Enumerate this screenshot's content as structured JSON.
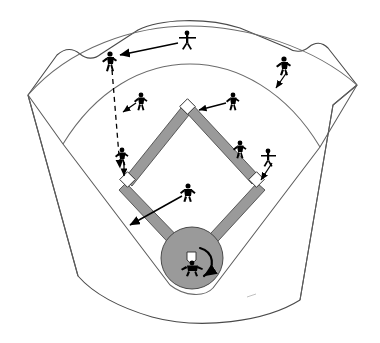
{
  "diagram": {
    "type": "baseball-field-schematic",
    "canvas": {
      "width": 380,
      "height": 343
    },
    "colors": {
      "background": "#ffffff",
      "outline": "#4a4a4a",
      "arc": "#6b6b6b",
      "basepath_fill": "#9a9a9a",
      "basepath_stroke": "#3c3c3c",
      "mound_fill": "#9a9a9a",
      "base_fill": "#ffffff",
      "figure": "#000000",
      "arrow": "#000000",
      "smudge": "#b9b9b9"
    }
  },
  "field": {
    "outfield_fence_label": "outfield-fence",
    "warning_track_arc_label": "warning-track-arc",
    "infield_arc_label": "infield-grass-arc",
    "left_foul_line_label": "left-foul-line",
    "right_foul_line_label": "right-foul-line",
    "backstop_arc_label": "backstop-arc"
  },
  "bases": [
    {
      "name": "second-base",
      "label": "2B",
      "x": 188,
      "y": 107
    },
    {
      "name": "third-base",
      "label": "3B",
      "x": 128,
      "y": 180
    },
    {
      "name": "first-base",
      "label": "1B",
      "x": 256,
      "y": 180
    },
    {
      "name": "home-plate",
      "label": "HP",
      "x": 192,
      "y": 256
    }
  ],
  "mound": {
    "name": "pitchers-mound-circle",
    "cx": 192,
    "cy": 258,
    "r": 31
  },
  "players": [
    {
      "name": "center-fielder",
      "position": "CF",
      "x": 187,
      "y": 40,
      "pose": "arms-out"
    },
    {
      "name": "left-fielder",
      "position": "LF",
      "x": 110,
      "y": 60,
      "pose": "running"
    },
    {
      "name": "right-fielder",
      "position": "RF",
      "x": 284,
      "y": 65,
      "pose": "running"
    },
    {
      "name": "shortstop",
      "position": "SS",
      "x": 140,
      "y": 100,
      "pose": "running"
    },
    {
      "name": "second-baseman",
      "position": "2B",
      "x": 232,
      "y": 100,
      "pose": "running"
    },
    {
      "name": "third-baseman",
      "position": "3B",
      "x": 122,
      "y": 155,
      "pose": "running"
    },
    {
      "name": "baserunner",
      "position": "R",
      "x": 240,
      "y": 148,
      "pose": "running"
    },
    {
      "name": "first-baseman",
      "position": "1B",
      "x": 268,
      "y": 157,
      "pose": "running"
    },
    {
      "name": "pitcher",
      "position": "P",
      "x": 187,
      "y": 192,
      "pose": "fielding"
    },
    {
      "name": "batter",
      "position": "B",
      "x": 192,
      "y": 266,
      "pose": "batting"
    }
  ],
  "movement_arrows": [
    {
      "name": "center-fielder-to-left-arrow",
      "from": "center-fielder",
      "to": "left-fielder",
      "style": "solid",
      "direction": "left"
    },
    {
      "name": "left-fielder-to-third-dashed-arrow",
      "from": "left-fielder",
      "to": "third-base",
      "style": "dashed",
      "direction": "down"
    },
    {
      "name": "shortstop-cutoff-arrow",
      "from": "shortstop",
      "to": "cutoff-position",
      "style": "solid",
      "direction": "down-left"
    },
    {
      "name": "second-baseman-to-second-base-arrow",
      "from": "second-baseman",
      "to": "second-base",
      "style": "solid",
      "direction": "left"
    },
    {
      "name": "right-fielder-backup-arrow",
      "from": "right-fielder",
      "to": "backup-position",
      "style": "solid",
      "direction": "down-left"
    },
    {
      "name": "first-baseman-to-first-base-arrow",
      "from": "first-baseman",
      "to": "first-base",
      "style": "solid",
      "direction": "down-left"
    },
    {
      "name": "pitcher-backup-arrow",
      "from": "pitcher",
      "to": "foul-territory",
      "style": "solid",
      "direction": "down-left"
    },
    {
      "name": "batter-swing-arc",
      "from": "batter",
      "to": "swing-follow-through",
      "style": "curved",
      "direction": "clockwise"
    }
  ]
}
